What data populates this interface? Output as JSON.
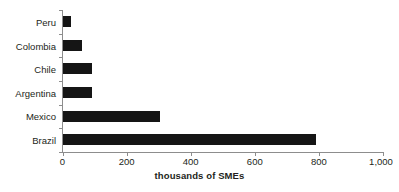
{
  "chart_data": {
    "type": "bar",
    "orientation": "horizontal",
    "title": "",
    "subtitle": "",
    "xlabel": "thousands of SMEs",
    "ylabel": "",
    "categories": [
      "Brazil",
      "Mexico",
      "Argentina",
      "Chile",
      "Colombia",
      "Peru"
    ],
    "values": [
      790,
      305,
      93,
      93,
      62,
      28
    ],
    "xlim": [
      0,
      1000
    ],
    "xticks": [
      0,
      200,
      400,
      600,
      800,
      1000
    ],
    "xticklabels": [
      "0",
      "200",
      "400",
      "600",
      "800",
      "1,000"
    ],
    "grid": false,
    "legend": null,
    "bar_color": "#151515",
    "axis_color": "#8d8d8d",
    "background_color": "#ffffff",
    "text_color": "#231f20"
  },
  "axis": {
    "x_title": "thousands of SMEs"
  }
}
